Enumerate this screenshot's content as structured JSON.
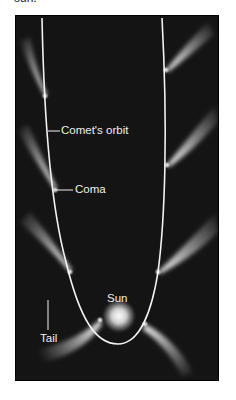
{
  "caption_fragment": "sun.",
  "diagram": {
    "labels": {
      "orbit": "Comet's orbit",
      "coma": "Coma",
      "sun": "Sun",
      "tail": "Tail"
    },
    "colors": {
      "background": "#141414",
      "orbit": "#f2f2f2",
      "label": "#f0f0f0",
      "sun": "#e8e8e8"
    },
    "comet_positions": [
      {
        "side": "left",
        "x": 45,
        "y": 96
      },
      {
        "side": "left",
        "x": 55,
        "y": 190
      },
      {
        "side": "left",
        "x": 70,
        "y": 272
      },
      {
        "side": "left",
        "x": 100,
        "y": 320
      },
      {
        "side": "right",
        "x": 166,
        "y": 70
      },
      {
        "side": "right",
        "x": 167,
        "y": 165
      },
      {
        "side": "right",
        "x": 158,
        "y": 272
      },
      {
        "side": "right",
        "x": 145,
        "y": 324
      }
    ]
  }
}
